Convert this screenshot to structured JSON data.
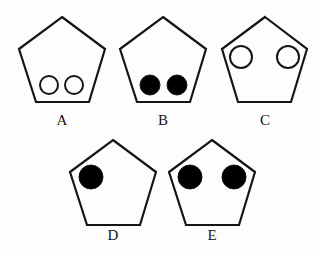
{
  "figure": {
    "background_color": "#fdfdfd",
    "outline_color": "#151515",
    "filled_circle_color": "#000000",
    "open_circle_fill": "#fdfdfd",
    "label_color": "#151515",
    "stroke_width": 2.2,
    "circle_stroke_width": 2.0,
    "canvas": {
      "width": 320,
      "height": 255
    },
    "items": [
      {
        "id": "a",
        "label": "A",
        "label_x": 62,
        "label_y": 125,
        "pentagon_points": "62,17 105,49 89,102 36,102 19,49",
        "circles": [
          {
            "cx": 49,
            "cy": 85,
            "r": 9,
            "fill": "open"
          },
          {
            "cx": 74,
            "cy": 85,
            "r": 9,
            "fill": "open"
          }
        ],
        "circle_count": 2,
        "circle_fill": "open",
        "circle_position": "bottom"
      },
      {
        "id": "b",
        "label": "B",
        "label_x": 163,
        "label_y": 125,
        "pentagon_points": "163,17 206,49 190,102 137,102 120,49",
        "circles": [
          {
            "cx": 150,
            "cy": 85,
            "r": 10,
            "fill": "solid"
          },
          {
            "cx": 177,
            "cy": 85,
            "r": 10,
            "fill": "solid"
          }
        ],
        "circle_count": 2,
        "circle_fill": "solid",
        "circle_position": "bottom"
      },
      {
        "id": "c",
        "label": "C",
        "label_x": 265,
        "label_y": 125,
        "pentagon_points": "265,17 307,49 291,102 238,102 222,49",
        "circles": [
          {
            "cx": 241,
            "cy": 57,
            "r": 11,
            "fill": "open"
          },
          {
            "cx": 288,
            "cy": 57,
            "r": 11,
            "fill": "open"
          }
        ],
        "circle_count": 2,
        "circle_fill": "open",
        "circle_position": "top"
      },
      {
        "id": "d",
        "label": "D",
        "label_x": 113,
        "label_y": 240,
        "pentagon_points": "113,140 156,172 140,225 87,225 70,172",
        "circles": [
          {
            "cx": 91,
            "cy": 177,
            "r": 12,
            "fill": "solid"
          }
        ],
        "circle_count": 1,
        "circle_fill": "solid",
        "circle_position": "top-left"
      },
      {
        "id": "e",
        "label": "E",
        "label_x": 212,
        "label_y": 240,
        "pentagon_points": "212,140 255,172 239,225 186,225 169,172",
        "circles": [
          {
            "cx": 190,
            "cy": 177,
            "r": 12,
            "fill": "solid"
          },
          {
            "cx": 234,
            "cy": 177,
            "r": 12,
            "fill": "solid"
          }
        ],
        "circle_count": 2,
        "circle_fill": "solid",
        "circle_position": "top"
      }
    ]
  }
}
